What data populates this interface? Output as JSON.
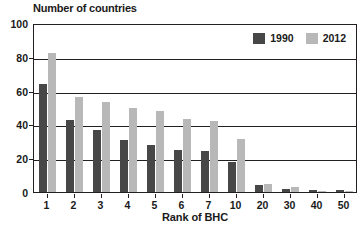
{
  "chart_data": {
    "type": "bar",
    "title": "",
    "xlabel": "Rank of BHC",
    "ylabel": "Number of countries",
    "categories": [
      "1",
      "2",
      "3",
      "4",
      "5",
      "6",
      "7",
      "10",
      "20",
      "30",
      "40",
      "50"
    ],
    "series": [
      {
        "name": "1990",
        "color": "#474747",
        "values": [
          64,
          42.5,
          36.5,
          30.5,
          28,
          25,
          24.5,
          18,
          4,
          2,
          1,
          1
        ]
      },
      {
        "name": "2012",
        "color": "#b8b8b8",
        "values": [
          82,
          56,
          53,
          50,
          48,
          43,
          42,
          31.5,
          5,
          3,
          0.5,
          0.5
        ]
      }
    ],
    "ylim": [
      0,
      100
    ],
    "yticks": [
      0,
      20,
      40,
      60,
      80,
      100
    ],
    "ytick_labels": [
      "0",
      "20",
      "40",
      "60",
      "80",
      "100"
    ],
    "grid": true,
    "grid_axis": "y",
    "legend_position": "top-right-inside",
    "frame_color": "#231f20",
    "background": "#ffffff"
  }
}
